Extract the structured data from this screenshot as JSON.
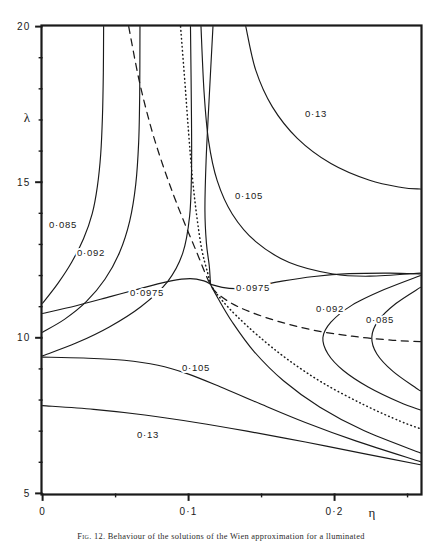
{
  "figure": {
    "caption_prefix": "Fig. 12.",
    "caption_text": "Behaviour of the solutions of the Wien approximation for a lluminated"
  },
  "axes": {
    "x_label": "η",
    "y_label": "λ",
    "x_ticks": [
      {
        "value": 0,
        "label": "0"
      },
      {
        "value": 0.1,
        "label": "0·1"
      },
      {
        "value": 0.2,
        "label": "0·2"
      }
    ],
    "y_ticks": [
      {
        "value": 20,
        "label": "20"
      },
      {
        "value": 15,
        "label": "15"
      },
      {
        "value": 10,
        "label": "10"
      },
      {
        "value": 5,
        "label": "5"
      }
    ],
    "x_minor_ticks": [
      0.05,
      0.15,
      0.25
    ],
    "y_minor_ticks": [
      19,
      18,
      17,
      16,
      14,
      13,
      12,
      11,
      9,
      8,
      7,
      6
    ],
    "xlim": [
      0,
      0.2588
    ],
    "ylim": [
      5,
      20
    ],
    "grid": false,
    "frame_color": "#1a1a1a"
  },
  "contour_labels": [
    {
      "id": "lbl-013-top",
      "text": "0·13",
      "x": 316,
      "y": 117
    },
    {
      "id": "lbl-0105-top",
      "text": "0·105",
      "x": 249,
      "y": 199
    },
    {
      "id": "lbl-0085-left",
      "text": "0·085",
      "x": 63,
      "y": 228
    },
    {
      "id": "lbl-0092-left",
      "text": "0·092",
      "x": 91,
      "y": 256
    },
    {
      "id": "lbl-00975-left",
      "text": "0·0975",
      "x": 147,
      "y": 296
    },
    {
      "id": "lbl-00975-right",
      "text": "0·0975",
      "x": 253,
      "y": 291
    },
    {
      "id": "lbl-0092-right",
      "text": "0·092",
      "x": 330,
      "y": 312
    },
    {
      "id": "lbl-0085-right",
      "text": "0·085",
      "x": 380,
      "y": 323
    },
    {
      "id": "lbl-0105-bot",
      "text": "0·105",
      "x": 196,
      "y": 371
    },
    {
      "id": "lbl-013-bot",
      "text": "0·13",
      "x": 148,
      "y": 438
    }
  ],
  "chart_data": {
    "type": "line",
    "title": "",
    "xlabel": "η",
    "ylabel": "λ",
    "xlim": [
      0,
      0.2588
    ],
    "ylim": [
      5,
      20
    ],
    "grid": false,
    "legend": "none",
    "contour_levels": [
      0.085,
      0.092,
      0.0975,
      0.105,
      0.13
    ],
    "series": [
      {
        "name": "0.085 upper-left branch",
        "level": 0.085,
        "style": "solid",
        "points": [
          [
            0.0,
            11.11
          ],
          [
            0.0105,
            11.75
          ],
          [
            0.0199,
            12.43
          ],
          [
            0.0281,
            13.19
          ],
          [
            0.034,
            13.99
          ],
          [
            0.0375,
            14.86
          ],
          [
            0.0398,
            15.9
          ],
          [
            0.041,
            17.11
          ],
          [
            0.0416,
            18.52
          ],
          [
            0.0418,
            20.0
          ]
        ]
      },
      {
        "name": "0.092 upper-left branch",
        "level": 0.092,
        "style": "solid",
        "points": [
          [
            0.0,
            10.18
          ],
          [
            0.0152,
            10.6
          ],
          [
            0.0299,
            11.16
          ],
          [
            0.0427,
            11.88
          ],
          [
            0.0527,
            12.74
          ],
          [
            0.0597,
            13.76
          ],
          [
            0.0638,
            14.93
          ],
          [
            0.0658,
            16.28
          ],
          [
            0.0665,
            17.78
          ],
          [
            0.0667,
            20.0
          ]
        ]
      },
      {
        "name": "0.0975 upper-left branch",
        "level": 0.0975,
        "style": "solid",
        "points": [
          [
            0.0,
            9.42
          ],
          [
            0.0229,
            9.83
          ],
          [
            0.0457,
            10.35
          ],
          [
            0.0673,
            11.0
          ],
          [
            0.0855,
            11.8
          ],
          [
            0.096,
            12.72
          ],
          [
            0.1007,
            13.9
          ],
          [
            0.102,
            15.3
          ],
          [
            0.102,
            17.0
          ],
          [
            0.1013,
            20.0
          ]
        ]
      },
      {
        "name": "0.105 upper branch",
        "level": 0.105,
        "style": "solid",
        "points": [
          [
            0.1085,
            20.0
          ],
          [
            0.1106,
            17.9
          ],
          [
            0.1137,
            16.33
          ],
          [
            0.1196,
            15.05
          ],
          [
            0.1299,
            13.98
          ],
          [
            0.146,
            13.09
          ],
          [
            0.169,
            12.42
          ],
          [
            0.199,
            12.05
          ],
          [
            0.224,
            11.98
          ],
          [
            0.2588,
            12.08
          ]
        ]
      },
      {
        "name": "0.13 upper branch",
        "level": 0.13,
        "style": "solid",
        "points": [
          [
            0.1392,
            20.0
          ],
          [
            0.146,
            18.6
          ],
          [
            0.1574,
            17.42
          ],
          [
            0.1745,
            16.41
          ],
          [
            0.1975,
            15.6
          ],
          [
            0.224,
            15.06
          ],
          [
            0.246,
            14.83
          ],
          [
            0.2588,
            14.78
          ]
        ]
      },
      {
        "name": "0.0975 saddle left-lower branch",
        "level": 0.0975,
        "style": "solid",
        "points": [
          [
            0.0,
            10.78
          ],
          [
            0.023,
            11.03
          ],
          [
            0.047,
            11.33
          ],
          [
            0.07,
            11.62
          ],
          [
            0.088,
            11.83
          ],
          [
            0.101,
            11.9
          ],
          [
            0.1105,
            11.83
          ],
          [
            0.115,
            11.72
          ]
        ]
      },
      {
        "name": "0.0975 saddle right-upper branch",
        "level": 0.0975,
        "style": "solid",
        "points": [
          [
            0.115,
            11.72
          ],
          [
            0.123,
            11.62
          ],
          [
            0.133,
            11.58
          ],
          [
            0.147,
            11.66
          ],
          [
            0.164,
            11.82
          ],
          [
            0.186,
            11.97
          ],
          [
            0.21,
            12.06
          ],
          [
            0.238,
            12.08
          ],
          [
            0.2588,
            12.05
          ]
        ]
      },
      {
        "name": "0.0975 saddle left-upper branch (descending from top)",
        "level": 0.0975,
        "style": "solid",
        "points": [
          [
            0.1167,
            20.0
          ],
          [
            0.114,
            17.6
          ],
          [
            0.112,
            15.7
          ],
          [
            0.1112,
            14.1
          ],
          [
            0.1122,
            13.05
          ],
          [
            0.1142,
            12.3
          ],
          [
            0.115,
            11.72
          ]
        ]
      },
      {
        "name": "0.0975 saddle right-descending branch",
        "level": 0.0975,
        "style": "solid",
        "points": [
          [
            0.115,
            11.72
          ],
          [
            0.12,
            11.28
          ],
          [
            0.13,
            10.5
          ],
          [
            0.145,
            9.55
          ],
          [
            0.165,
            8.62
          ],
          [
            0.19,
            7.77
          ],
          [
            0.22,
            7.02
          ],
          [
            0.2588,
            6.3
          ]
        ]
      },
      {
        "name": "0.092 right closed branch",
        "level": 0.092,
        "style": "solid",
        "points": [
          [
            0.2588,
            12.0
          ],
          [
            0.234,
            11.55
          ],
          [
            0.212,
            11.05
          ],
          [
            0.1975,
            10.5
          ],
          [
            0.192,
            10.0
          ],
          [
            0.1955,
            9.48
          ],
          [
            0.206,
            8.95
          ],
          [
            0.223,
            8.42
          ],
          [
            0.245,
            7.92
          ],
          [
            0.2588,
            7.68
          ]
        ]
      },
      {
        "name": "0.085 right closed branch",
        "level": 0.085,
        "style": "solid",
        "points": [
          [
            0.2588,
            11.62
          ],
          [
            0.242,
            11.1
          ],
          [
            0.23,
            10.55
          ],
          [
            0.2255,
            10.02
          ],
          [
            0.229,
            9.48
          ],
          [
            0.24,
            8.92
          ],
          [
            0.256,
            8.38
          ],
          [
            0.2588,
            8.3
          ]
        ]
      },
      {
        "name": "0.105 lower branch",
        "level": 0.105,
        "style": "solid",
        "points": [
          [
            0.0,
            9.38
          ],
          [
            0.028,
            9.35
          ],
          [
            0.056,
            9.28
          ],
          [
            0.079,
            9.12
          ],
          [
            0.099,
            8.85
          ],
          [
            0.122,
            8.42
          ],
          [
            0.149,
            7.88
          ],
          [
            0.18,
            7.28
          ],
          [
            0.215,
            6.68
          ],
          [
            0.2588,
            6.02
          ]
        ]
      },
      {
        "name": "0.13 lower branch",
        "level": 0.13,
        "style": "solid",
        "points": [
          [
            0.0,
            7.82
          ],
          [
            0.035,
            7.7
          ],
          [
            0.07,
            7.52
          ],
          [
            0.105,
            7.28
          ],
          [
            0.14,
            7.0
          ],
          [
            0.18,
            6.65
          ],
          [
            0.22,
            6.28
          ],
          [
            0.2588,
            5.92
          ]
        ]
      },
      {
        "name": "separatrix (dashed)",
        "style": "dashed",
        "points": [
          [
            0.059,
            20.0
          ],
          [
            0.066,
            18.3
          ],
          [
            0.074,
            16.8
          ],
          [
            0.082,
            15.6
          ],
          [
            0.09,
            14.55
          ],
          [
            0.098,
            13.6
          ],
          [
            0.106,
            12.7
          ],
          [
            0.113,
            11.9
          ],
          [
            0.118,
            11.5
          ],
          [
            0.129,
            11.12
          ],
          [
            0.143,
            10.82
          ],
          [
            0.162,
            10.52
          ],
          [
            0.185,
            10.25
          ],
          [
            0.212,
            10.05
          ],
          [
            0.24,
            9.92
          ],
          [
            0.2588,
            9.88
          ]
        ]
      },
      {
        "name": "critical locus (dotted)",
        "style": "dotted",
        "points": [
          [
            0.0945,
            20.0
          ],
          [
            0.0975,
            18.2
          ],
          [
            0.1,
            16.6
          ],
          [
            0.1025,
            15.2
          ],
          [
            0.1055,
            13.95
          ],
          [
            0.109,
            12.85
          ],
          [
            0.113,
            12.1
          ],
          [
            0.116,
            11.65
          ],
          [
            0.123,
            11.2
          ],
          [
            0.133,
            10.7
          ],
          [
            0.148,
            10.05
          ],
          [
            0.168,
            9.3
          ],
          [
            0.192,
            8.55
          ],
          [
            0.22,
            7.85
          ],
          [
            0.245,
            7.32
          ],
          [
            0.2588,
            7.08
          ]
        ]
      }
    ]
  }
}
